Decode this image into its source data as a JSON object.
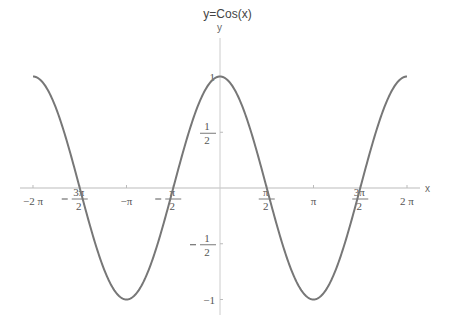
{
  "chart_data": {
    "type": "line",
    "title": "y=Cos(x)",
    "xlabel": "x",
    "ylabel": "y",
    "function": "cos(x)",
    "xlim": [
      -6.2832,
      6.2832
    ],
    "ylim": [
      -1,
      1
    ],
    "grid": false,
    "legend": null,
    "x_ticks": [
      {
        "value": -6.2832,
        "label": "-2π"
      },
      {
        "value": -4.7124,
        "label": "-3π/2"
      },
      {
        "value": -3.1416,
        "label": "-π"
      },
      {
        "value": -1.5708,
        "label": "-π/2"
      },
      {
        "value": 1.5708,
        "label": "π/2"
      },
      {
        "value": 3.1416,
        "label": "π"
      },
      {
        "value": 4.7124,
        "label": "3π/2"
      },
      {
        "value": 6.2832,
        "label": "2π"
      }
    ],
    "y_ticks": [
      {
        "value": 1,
        "label": "1"
      },
      {
        "value": 0.5,
        "label": "1/2"
      },
      {
        "value": -0.5,
        "label": "-1/2"
      },
      {
        "value": -1,
        "label": "-1"
      }
    ],
    "series": [
      {
        "name": "cos(x)",
        "color": "#777777",
        "x": [
          -6.2832,
          -4.7124,
          -3.1416,
          -1.5708,
          0,
          1.5708,
          3.1416,
          4.7124,
          6.2832
        ],
        "values": [
          1,
          0,
          -1,
          0,
          1,
          0,
          -1,
          0,
          1
        ]
      }
    ]
  }
}
